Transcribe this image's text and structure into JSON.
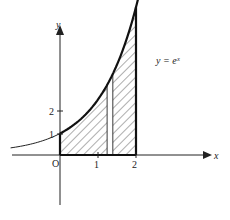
{
  "diagram": {
    "function_label": "y = eˣ",
    "axes": {
      "x_label": "x",
      "y_label": "y",
      "origin_label": "O",
      "x_ticks": [
        "1",
        "2"
      ],
      "y_ticks": [
        "1",
        "2"
      ]
    },
    "shaded_region": {
      "from_x": 0,
      "to_x": 2,
      "description": "Area under y = e^x from x=0 to x=2, hatched, with a thin unhatched vertical strip near x≈1.3"
    },
    "strip": {
      "from_x": 1.24,
      "to_x": 1.39
    }
  }
}
